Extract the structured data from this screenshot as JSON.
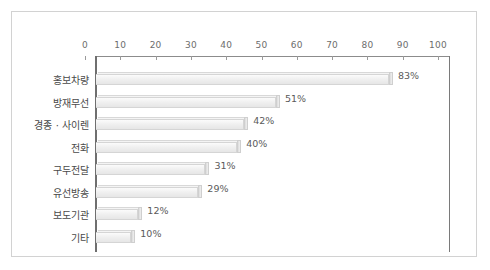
{
  "chart_data": {
    "type": "bar",
    "orientation": "horizontal",
    "title": "",
    "xlabel": "",
    "ylabel": "",
    "xlim": [
      0,
      100
    ],
    "xticks": [
      0,
      10,
      20,
      30,
      40,
      50,
      60,
      70,
      80,
      90,
      100
    ],
    "grid": false,
    "legend": null,
    "value_suffix": "%",
    "categories": [
      "홍보차량",
      "방재무선",
      "경종 · 사이렌",
      "전화",
      "구두전달",
      "유선방송",
      "보도기관",
      "기타"
    ],
    "values": [
      83,
      51,
      42,
      40,
      31,
      29,
      12,
      10
    ],
    "data_labels": [
      "83%",
      "51%",
      "42%",
      "40%",
      "31%",
      "29%",
      "12%",
      "10%"
    ],
    "colors": {
      "bar_face": "#f0f0f0",
      "bar_edge": "#d5d5d5",
      "axis": "#6f6f6f",
      "text": "#4a4a4a",
      "frame": "#d2d2d2",
      "background": "#ffffff"
    }
  }
}
